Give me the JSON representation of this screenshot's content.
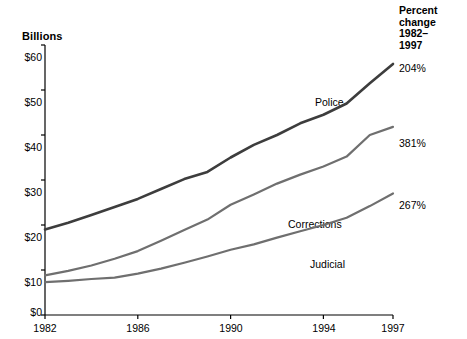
{
  "chart_data": {
    "type": "line",
    "title": "",
    "ylabel": "Billions",
    "xlabel": "",
    "x": [
      1982,
      1983,
      1984,
      1985,
      1986,
      1987,
      1988,
      1989,
      1990,
      1991,
      1992,
      1993,
      1994,
      1995,
      1996,
      1997
    ],
    "xlim": [
      1982,
      1997
    ],
    "ylim": [
      0,
      60
    ],
    "yticks": [
      "$0",
      "$10",
      "$20",
      "$30",
      "$40",
      "$50",
      "$60"
    ],
    "ytick_values": [
      0,
      10,
      20,
      30,
      40,
      50,
      60
    ],
    "xticks": [
      "1982",
      "1986",
      "1990",
      "1994",
      "1997"
    ],
    "xtick_values": [
      1982,
      1986,
      1990,
      1994,
      1997
    ],
    "grid": false,
    "legend_position": "inline-annotations",
    "series": [
      {
        "name": "Police",
        "label": "Police",
        "percent_change": "204%",
        "color": "#3d3d3d",
        "values": [
          19.0,
          20.5,
          22.2,
          24.0,
          25.8,
          28.0,
          30.2,
          31.8,
          35.0,
          37.8,
          40.0,
          42.6,
          44.5,
          47.0,
          51.5,
          55.8
        ]
      },
      {
        "name": "Corrections",
        "label": "Corrections",
        "percent_change": "381%",
        "color": "#6f6f6f",
        "values": [
          8.8,
          9.8,
          11.0,
          12.5,
          14.2,
          16.5,
          18.9,
          21.2,
          24.5,
          26.8,
          29.2,
          31.2,
          33.0,
          35.2,
          40.0,
          41.8
        ]
      },
      {
        "name": "Judicial",
        "label": "Judicial",
        "percent_change": "267%",
        "color": "#6f6f6f",
        "values": [
          7.3,
          7.6,
          8.0,
          8.3,
          9.2,
          10.3,
          11.6,
          13.0,
          14.5,
          15.7,
          17.2,
          18.6,
          20.0,
          21.6,
          24.2,
          27.0
        ]
      }
    ],
    "annotations": {
      "percent_change_header": "Percent\nchange\n1982–\n1997",
      "percent_change_header_lines": [
        "Percent",
        "change",
        "1982–",
        "1997"
      ]
    }
  }
}
